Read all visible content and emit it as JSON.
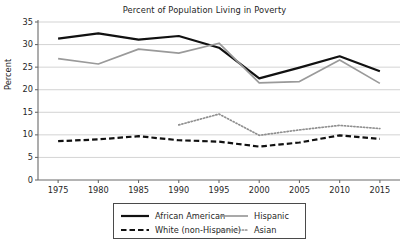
{
  "chart_data": {
    "type": "line",
    "title": "Percent of Population Living in Poverty",
    "xlabel": "",
    "ylabel": "Percent",
    "x": [
      1975,
      1980,
      1985,
      1990,
      1995,
      2000,
      2005,
      2010,
      2015
    ],
    "xtick_labels": [
      "1975",
      "1980",
      "1985",
      "1990",
      "1995",
      "2000",
      "2005",
      "2010",
      "2015"
    ],
    "ytick_labels": [
      "0",
      "5",
      "10",
      "15",
      "20",
      "25",
      "30",
      "35"
    ],
    "xlim": [
      1972.5,
      2017.5
    ],
    "ylim": [
      0,
      35
    ],
    "grid": "horizontal",
    "legend_position": "below-axes",
    "series": [
      {
        "name": "African American",
        "style": "solid",
        "color": "#111111",
        "width": 2.2,
        "x": [
          1975,
          1980,
          1985,
          1990,
          1995,
          2000,
          2005,
          2010,
          2015
        ],
        "values": [
          31.3,
          32.5,
          31.1,
          31.9,
          29.3,
          22.5,
          24.9,
          27.4,
          24.1
        ]
      },
      {
        "name": "Hispanic",
        "style": "solid",
        "color": "#9a9a9a",
        "width": 1.7,
        "x": [
          1975,
          1980,
          1985,
          1990,
          1995,
          2000,
          2005,
          2010,
          2015
        ],
        "values": [
          26.9,
          25.7,
          29.0,
          28.1,
          30.3,
          21.5,
          21.8,
          26.6,
          21.4
        ]
      },
      {
        "name": "White (non-Hispanic)",
        "style": "dashed",
        "color": "#111111",
        "width": 2.2,
        "x": [
          1975,
          1980,
          1985,
          1990,
          1995,
          2000,
          2005,
          2010,
          2015
        ],
        "values": [
          8.6,
          9.0,
          9.7,
          8.8,
          8.5,
          7.4,
          8.3,
          9.9,
          9.1
        ]
      },
      {
        "name": "Asian",
        "style": "dotted",
        "color": "#8f8f8f",
        "width": 1.7,
        "x": [
          1990,
          1995,
          2000,
          2005,
          2010,
          2015
        ],
        "values": [
          12.2,
          14.6,
          9.9,
          11.1,
          12.1,
          11.4
        ]
      }
    ],
    "legend": [
      {
        "label": "African American",
        "style": "solid",
        "color": "#111111"
      },
      {
        "label": "Hispanic",
        "style": "solid",
        "color": "#9a9a9a"
      },
      {
        "label": "White (non-Hispanic)",
        "style": "dashed",
        "color": "#111111"
      },
      {
        "label": "Asian",
        "style": "dotted",
        "color": "#8f8f8f"
      }
    ]
  }
}
